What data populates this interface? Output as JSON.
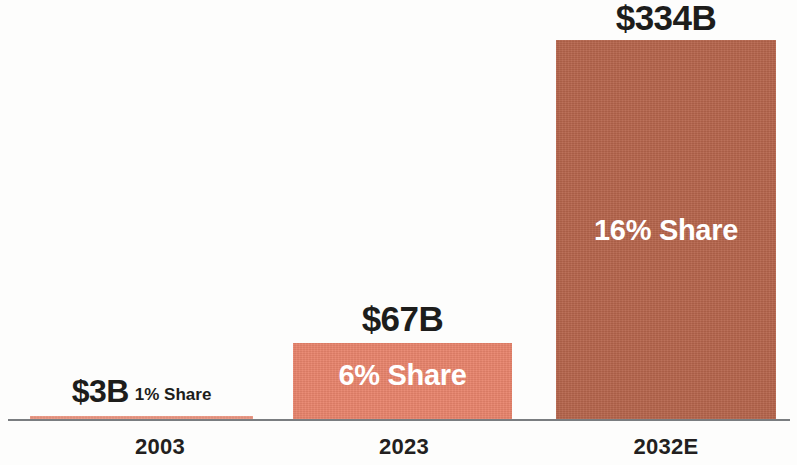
{
  "chart_data": {
    "type": "bar",
    "title": "",
    "subtitle": "",
    "xlabel": "",
    "ylabel": "",
    "grid": false,
    "legend": false,
    "ylim": [
      0,
      370
    ],
    "categories": [
      "2003",
      "2023",
      "2032E"
    ],
    "series": [
      {
        "name": "Market size (US$ billions)",
        "values": [
          3,
          67,
          334
        ],
        "value_labels": [
          "$3B",
          "$67B",
          "$334B"
        ]
      },
      {
        "name": "Share of market",
        "values": [
          1,
          6,
          16
        ],
        "value_labels": [
          "1% Share",
          "6% Share",
          "16% Share"
        ]
      }
    ],
    "bars": [
      {
        "category": "2003",
        "value": 3,
        "value_label": "$3B",
        "share_label": "1% Share",
        "share_percent": 1,
        "color": "#E8836B",
        "share_label_position": "inline-right"
      },
      {
        "category": "2023",
        "value": 67,
        "value_label": "$67B",
        "share_label": "6% Share",
        "share_percent": 6,
        "color": "#E8836B",
        "share_label_position": "inside"
      },
      {
        "category": "2032E",
        "value": 334,
        "value_label": "$334B",
        "share_label": "16% Share",
        "share_percent": 16,
        "color": "#B5644B",
        "share_label_position": "inside"
      }
    ],
    "colors": {
      "bar_light": "#E8836B",
      "bar_dark": "#B5644B",
      "text": "#1D1D1B",
      "in_bar_text": "#FFFFFF",
      "axis": "#7A7D80",
      "background": "#FDFDFC"
    }
  }
}
